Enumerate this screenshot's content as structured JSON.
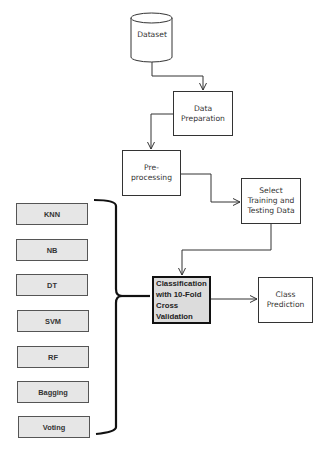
{
  "diagram": {
    "type": "flowchart",
    "nodes": {
      "dataset": {
        "label": "Dataset",
        "shape": "cylinder"
      },
      "data_preparation": {
        "label": "Data Preparation",
        "lines": [
          "Data",
          "Preparation"
        ]
      },
      "preprocessing": {
        "label": "Pre-processing",
        "lines": [
          "Pre-",
          "processing"
        ]
      },
      "select_data": {
        "label": "Select Training and Testing Data",
        "lines": [
          "Select",
          "Training and",
          "Testing Data"
        ]
      },
      "classification": {
        "label": "Classification with 10-Fold Cross Validation",
        "lines": [
          "Classification",
          "with 10-Fold",
          "Cross",
          "Validation"
        ]
      },
      "class_prediction": {
        "label": "Class Prediction",
        "lines": [
          "Class",
          "Prediction"
        ]
      }
    },
    "algorithms": [
      {
        "label": "KNN"
      },
      {
        "label": "NB"
      },
      {
        "label": "DT"
      },
      {
        "label": "SVM"
      },
      {
        "label": "RF"
      },
      {
        "label": "Bagging"
      },
      {
        "label": "Voting"
      }
    ],
    "edges": [
      {
        "from": "Dataset",
        "to": "Data Preparation"
      },
      {
        "from": "Data Preparation",
        "to": "Pre-processing"
      },
      {
        "from": "Pre-processing",
        "to": "Select Training and Testing Data"
      },
      {
        "from": "Select Training and Testing Data",
        "to": "Classification with 10-Fold Cross Validation"
      },
      {
        "from": "Classification with 10-Fold Cross Validation",
        "to": "Class Prediction"
      },
      {
        "from": "Algorithms (brace)",
        "to": "Classification with 10-Fold Cross Validation"
      }
    ],
    "colors": {
      "line": "#333333",
      "algo_fill": "#e6e6e6",
      "highlight_fill": "#dcdcdc",
      "highlight_border": "#111111"
    }
  }
}
